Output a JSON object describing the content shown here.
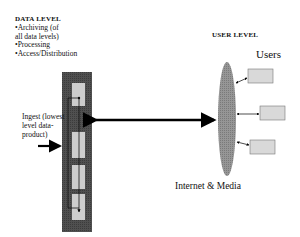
{
  "data_level": {
    "heading": "DATA LEVEL",
    "bullets": [
      "•Archiving (of",
      "all data levels)",
      "•Processing",
      "•Access/Distribution"
    ]
  },
  "ingest": {
    "lines": [
      "Ingest (lowest",
      "level data-",
      "product)"
    ]
  },
  "user_level": {
    "heading": "USER LEVEL",
    "users_label": "Users",
    "network_label": "Internet & Media"
  },
  "colors": {
    "column_fill": "#4a4a4a",
    "box_fill": "#cfcfcf",
    "ellipse_fill": "#8c8c8c",
    "user_box_fill": "#d9d9d9",
    "arrow": "#000000"
  }
}
